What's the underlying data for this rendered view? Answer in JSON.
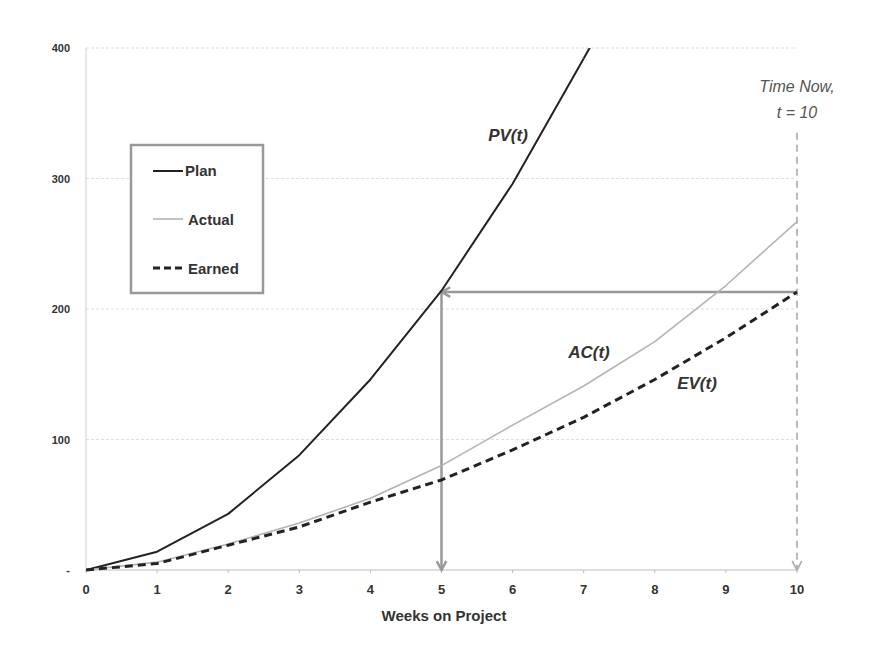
{
  "chart_data": {
    "type": "line",
    "title": "",
    "xlabel": "Weeks on Project",
    "ylabel": "",
    "x": [
      0,
      1,
      2,
      3,
      4,
      5,
      6,
      7,
      8,
      9,
      10
    ],
    "x_ticks": [
      "0",
      "1",
      "2",
      "3",
      "4",
      "5",
      "6",
      "7",
      "8",
      "9",
      "10"
    ],
    "y_ticks": [
      "-",
      "100",
      "200",
      "300",
      "400"
    ],
    "xlim": [
      0,
      10
    ],
    "ylim": [
      0,
      400
    ],
    "grid": {
      "horizontal": true,
      "vertical": false
    },
    "legend_position": "upper-left inset",
    "series": [
      {
        "name": "Plan",
        "style": "solid",
        "color": "#222222",
        "width": 2,
        "x": [
          0,
          1,
          2,
          3,
          4,
          5,
          6,
          7
        ],
        "values": [
          0,
          14,
          43,
          88,
          146,
          214,
          296,
          392
        ],
        "annotation": "PV(t)"
      },
      {
        "name": "Actual",
        "style": "solid",
        "color": "#b3b3b3",
        "width": 1.6,
        "x": [
          0,
          1,
          2,
          3,
          4,
          5,
          6,
          7,
          8,
          9,
          10
        ],
        "values": [
          0,
          6,
          20,
          36,
          55,
          80,
          111,
          141,
          175,
          218,
          267
        ],
        "annotation": "AC(t)"
      },
      {
        "name": "Earned",
        "style": "dashed",
        "color": "#222222",
        "width": 3,
        "x": [
          0,
          1,
          2,
          3,
          4,
          5,
          6,
          7,
          8,
          9,
          10
        ],
        "values": [
          0,
          5,
          19,
          33,
          52,
          69,
          92,
          117,
          146,
          178,
          213
        ],
        "annotation": "EV(t)"
      }
    ],
    "annotations": [
      {
        "text": "PV(t)",
        "x": 5.9,
        "y": 335
      },
      {
        "text": "AC(t)",
        "x": 7.0,
        "y": 167
      },
      {
        "text": "EV(t)",
        "x": 8.6,
        "y": 144
      },
      {
        "text": "Time Now,",
        "x": 10,
        "y": 370
      },
      {
        "text": "t = 10",
        "x": 10,
        "y": 350
      }
    ],
    "arrows": [
      {
        "name": "earned-to-plan-horizontal",
        "from": [
          10,
          213
        ],
        "to": [
          5,
          213
        ],
        "style": "solid",
        "color": "#999999"
      },
      {
        "name": "plan-to-axis-vertical",
        "from": [
          5,
          213
        ],
        "to": [
          5,
          0
        ],
        "style": "solid",
        "color": "#999999"
      },
      {
        "name": "time-now-vertical",
        "from": [
          10,
          335
        ],
        "to": [
          10,
          0
        ],
        "style": "dashed",
        "color": "#aaaaaa"
      }
    ]
  },
  "legend": {
    "items": [
      {
        "label": "Plan"
      },
      {
        "label": "Actual"
      },
      {
        "label": "Earned"
      }
    ]
  },
  "labels": {
    "pv": "PV(t)",
    "ac": "AC(t)",
    "ev": "EV(t)",
    "time_now_line1": "Time Now,",
    "time_now_line2": "t = 10",
    "x_axis_title": "Weeks on Project"
  }
}
